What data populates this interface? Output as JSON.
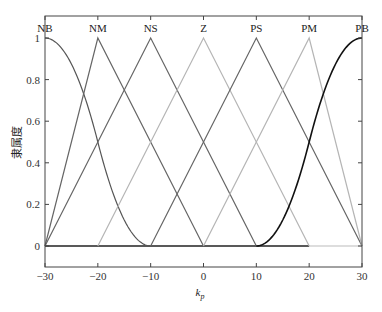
{
  "chart_data": {
    "type": "line",
    "title": "",
    "xlabel": "k_p",
    "xlabel_main": "k",
    "xlabel_sub": "p",
    "ylabel": "隶属度",
    "xlim": [
      -30,
      30
    ],
    "ylim": [
      0,
      1
    ],
    "xticks": [
      -30,
      -20,
      -10,
      0,
      10,
      20,
      30
    ],
    "yticks": [
      0,
      0.2,
      0.4,
      0.6,
      0.8,
      1
    ],
    "ytick_labels": [
      "0",
      "0.2",
      "0.4",
      "0.6",
      "0.8",
      "1"
    ],
    "grid": false,
    "legend": "set labels along top axis",
    "series": [
      {
        "name": "NB",
        "shape": "zmf",
        "params": [
          -30,
          -10
        ],
        "x": [
          -30,
          -10
        ],
        "color": "#555555"
      },
      {
        "name": "NM",
        "shape": "trimf",
        "params": [
          -30,
          -20,
          0
        ],
        "x": [
          -30,
          -20,
          0
        ],
        "y": [
          0,
          1,
          0
        ],
        "color": "#666666"
      },
      {
        "name": "NS",
        "shape": "trimf",
        "params": [
          -30,
          -10,
          10
        ],
        "x": [
          -30,
          -10,
          10
        ],
        "y": [
          0,
          1,
          0
        ],
        "color": "#666666"
      },
      {
        "name": "Z",
        "shape": "trimf",
        "params": [
          -20,
          0,
          20
        ],
        "x": [
          -20,
          0,
          20
        ],
        "y": [
          0,
          1,
          0
        ],
        "color": "#b5b5b5"
      },
      {
        "name": "PS",
        "shape": "trimf",
        "params": [
          -10,
          10,
          30
        ],
        "x": [
          -10,
          10,
          30
        ],
        "y": [
          0,
          1,
          0
        ],
        "color": "#666666"
      },
      {
        "name": "PM",
        "shape": "trimf",
        "params": [
          0,
          20,
          30
        ],
        "x": [
          0,
          20,
          30
        ],
        "y": [
          0,
          1,
          0
        ],
        "color": "#b5b5b5"
      },
      {
        "name": "PB",
        "shape": "smf",
        "params": [
          10,
          30
        ],
        "x": [
          10,
          30
        ],
        "color": "#111111"
      }
    ]
  }
}
